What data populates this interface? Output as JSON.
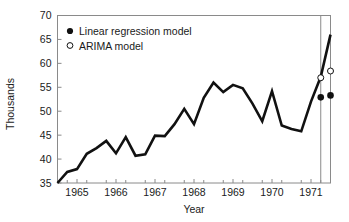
{
  "chart_data": {
    "type": "line",
    "title": "",
    "xlabel": "Year",
    "ylabel": "Thousands",
    "xlim": [
      1964.5,
      1971.5
    ],
    "ylim": [
      35,
      70
    ],
    "grid": false,
    "legend_position": "top-left",
    "y_ticks": [
      35,
      40,
      45,
      50,
      55,
      60,
      65,
      70
    ],
    "y_tick_labels": [
      "35",
      "40",
      "45",
      "50",
      "55",
      "60",
      "65",
      "70"
    ],
    "x_ticks": [
      1965,
      1966,
      1967,
      1968,
      1969,
      1970,
      1971
    ],
    "x_tick_labels": [
      "1965",
      "1966",
      "1967",
      "1968",
      "1969",
      "1970",
      "1971"
    ],
    "x_minor_ticks": [
      1964.75,
      1965.25,
      1965.75,
      1966.25,
      1966.75,
      1967.25,
      1967.75,
      1968.25,
      1968.75,
      1969.25,
      1969.75,
      1970.25,
      1970.75,
      1971.25
    ],
    "legend": [
      {
        "name": "Linear regression model",
        "marker": "filled-circle",
        "color": "#111111"
      },
      {
        "name": "ARIMA model",
        "marker": "open-circle",
        "color": "#111111"
      }
    ],
    "series": [
      {
        "name": "observed",
        "marker": "none",
        "color": "#111111",
        "x": [
          1964.5,
          1964.75,
          1965.0,
          1965.25,
          1965.5,
          1965.75,
          1966.0,
          1966.25,
          1966.5,
          1966.75,
          1967.0,
          1967.25,
          1967.5,
          1967.75,
          1968.0,
          1968.25,
          1968.5,
          1968.75,
          1969.0,
          1969.25,
          1969.5,
          1969.75,
          1970.0,
          1970.25,
          1970.5,
          1970.75,
          1971.0,
          1971.25,
          1971.5
        ],
        "values": [
          35.0,
          37.3,
          37.9,
          41.1,
          42.3,
          43.8,
          41.2,
          44.6,
          40.7,
          41.0,
          44.9,
          44.8,
          47.3,
          50.5,
          47.3,
          52.8,
          56.0,
          54.0,
          55.5,
          54.8,
          51.6,
          47.9,
          54.2,
          47.0,
          46.3,
          45.8,
          52.0,
          57.2,
          66.0
        ]
      },
      {
        "name": "ARIMA model forecast",
        "marker": "open-circle",
        "color": "#111111",
        "x": [
          1971.25,
          1971.5
        ],
        "values": [
          57.0,
          58.4
        ]
      },
      {
        "name": "Linear regression model forecast",
        "marker": "filled-circle",
        "color": "#111111",
        "x": [
          1971.25,
          1971.5
        ],
        "values": [
          52.9,
          53.3
        ]
      }
    ],
    "forecast_divider_x": 1971.25
  }
}
